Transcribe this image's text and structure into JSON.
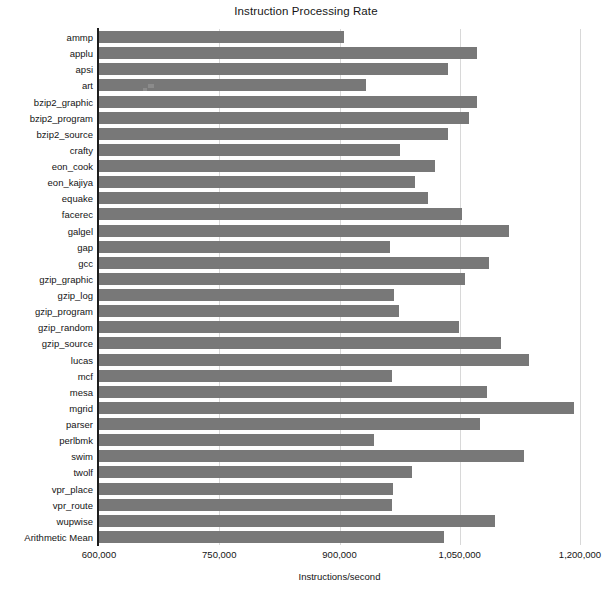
{
  "chart_data": {
    "type": "bar",
    "orientation": "horizontal",
    "title": "Instruction Processing Rate",
    "xlabel": "Instructions/second",
    "ylabel": "",
    "xlim": [
      600000,
      1200000
    ],
    "xticks": [
      "600,000",
      "750,000",
      "900,000",
      "1,050,000",
      "1,200,000"
    ],
    "xtick_values": [
      600000,
      750000,
      900000,
      1050000,
      1200000
    ],
    "grid": true,
    "grid_axis": "x",
    "legend": null,
    "bar_color": "#787878",
    "categories": [
      "ammp",
      "applu",
      "apsi",
      "art",
      "bzip2_graphic",
      "bzip2_program",
      "bzip2_source",
      "crafty",
      "eon_cook",
      "eon_kajiya",
      "equake",
      "facerec",
      "galgel",
      "gap",
      "gcc",
      "gzip_graphic",
      "gzip_log",
      "gzip_program",
      "gzip_random",
      "gzip_source",
      "lucas",
      "mcf",
      "mesa",
      "mgrid",
      "parser",
      "perlbmk",
      "swim",
      "twolf",
      "vpr_place",
      "vpr_route",
      "wupwise",
      "Arithmetic Mean"
    ],
    "values": [
      906000,
      1071000,
      1035000,
      933000,
      1071000,
      1062000,
      1035000,
      975000,
      1019000,
      994000,
      1011000,
      1053000,
      1112000,
      963000,
      1087000,
      1057000,
      968000,
      974000,
      1049000,
      1102000,
      1136000,
      966000,
      1084000,
      1193000,
      1075000,
      943000,
      1130000,
      990000,
      967000,
      966000,
      1094000,
      1030000
    ]
  }
}
